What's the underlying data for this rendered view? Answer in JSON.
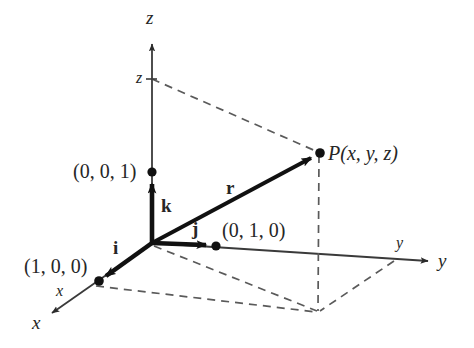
{
  "figure": {
    "background_color": "#ffffff",
    "ink_color": "#262626",
    "dashed_color": "#555555",
    "thin_axis_color": "#333333"
  },
  "axes": [
    {
      "key": "x",
      "label": "x",
      "tick_label": "x"
    },
    {
      "key": "y",
      "label": "y",
      "tick_label": "y"
    },
    {
      "key": "z",
      "label": "z",
      "tick_label": "z"
    }
  ],
  "labels": {
    "axis_x": "x",
    "axis_y": "y",
    "axis_z": "z",
    "tick_x": "x",
    "tick_y": "y",
    "tick_z": "z",
    "unit_point_x": "(1, 0, 0)",
    "unit_point_y": "(0, 1, 0)",
    "unit_point_z": "(0, 0, 1)",
    "point_p": "P(x, y, z)",
    "basis_i": "i",
    "basis_j": "j",
    "basis_k": "k",
    "vector_r": "r"
  },
  "points": [
    {
      "name": "origin",
      "label": "",
      "x": 152,
      "y": 243,
      "dot": false
    },
    {
      "name": "unit-x",
      "label": "(1, 0, 0)",
      "x": 99,
      "y": 281,
      "dot": true
    },
    {
      "name": "unit-y",
      "label": "(0, 1, 0)",
      "x": 216,
      "y": 246,
      "dot": true
    },
    {
      "name": "unit-z",
      "label": "(0, 0, 1)",
      "x": 152,
      "y": 172,
      "dot": true
    },
    {
      "name": "point-p",
      "label": "P(x, y, z)",
      "x": 320,
      "y": 153,
      "dot": true
    },
    {
      "name": "p-projection-xy",
      "label": "",
      "x": 318,
      "y": 312,
      "dot": false
    },
    {
      "name": "z-tick-on-axis",
      "label": "z",
      "x": 152,
      "y": 79,
      "dot": false
    },
    {
      "name": "y-tick-on-axis",
      "label": "y",
      "x": 395,
      "y": 261,
      "dot": false
    },
    {
      "name": "x-tick-on-axis",
      "label": "x",
      "x": 95,
      "y": 285,
      "dot": false
    }
  ],
  "vectors": [
    {
      "name": "i",
      "label": "i",
      "from": [
        152,
        243
      ],
      "to": [
        99,
        281
      ],
      "style": "thick-solid"
    },
    {
      "name": "j",
      "label": "j",
      "from": [
        152,
        243
      ],
      "to": [
        216,
        246
      ],
      "style": "thick-solid"
    },
    {
      "name": "k",
      "label": "k",
      "from": [
        152,
        243
      ],
      "to": [
        152,
        177
      ],
      "style": "thick-solid"
    },
    {
      "name": "r",
      "label": "r",
      "from": [
        152,
        243
      ],
      "to": [
        320,
        153
      ],
      "style": "thick-solid"
    }
  ],
  "dashed_edges": [
    {
      "name": "z-to-p",
      "from": [
        152,
        79
      ],
      "to": [
        320,
        153
      ]
    },
    {
      "name": "p-to-projection",
      "from": [
        320,
        153
      ],
      "to": [
        318,
        312
      ]
    },
    {
      "name": "origin-to-projection",
      "from": [
        152,
        245
      ],
      "to": [
        318,
        312
      ]
    },
    {
      "name": "x-tick-to-projection",
      "from": [
        95,
        285
      ],
      "to": [
        318,
        312
      ]
    },
    {
      "name": "y-tick-to-projection",
      "from": [
        395,
        261
      ],
      "to": [
        318,
        312
      ]
    }
  ]
}
